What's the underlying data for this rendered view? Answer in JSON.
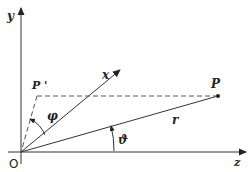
{
  "diagram": {
    "colors": {
      "line": "#333333",
      "text": "#222222",
      "background": "#ffffff"
    },
    "labels": {
      "y_axis": "y",
      "z_axis": "z",
      "x_axis": "x",
      "origin": "O",
      "point_p": "P",
      "point_p_prime": "P '",
      "radius": "r",
      "angle_phi": "φ",
      "angle_theta": "ϑ"
    },
    "nodes": [
      {
        "id": "O",
        "x": 21,
        "y": 152
      },
      {
        "id": "P",
        "x": 218,
        "y": 96
      },
      {
        "id": "P_prime",
        "x": 36,
        "y": 96
      },
      {
        "id": "x_tip",
        "x": 121,
        "y": 69
      }
    ],
    "edges": [
      {
        "from": "O",
        "to": "y_tip",
        "style": "solid",
        "arrow": true
      },
      {
        "from": "O",
        "to": "z_tip",
        "style": "solid",
        "arrow": true
      },
      {
        "from": "O",
        "to": "x_tip",
        "style": "solid",
        "arrow": true
      },
      {
        "from": "O",
        "to": "P",
        "style": "solid",
        "arrow": false,
        "label": "r"
      },
      {
        "from": "P",
        "to": "P_prime",
        "style": "dashed",
        "arrow": false
      },
      {
        "from": "P_prime",
        "to": "O",
        "style": "dashed",
        "arrow": false
      }
    ]
  }
}
